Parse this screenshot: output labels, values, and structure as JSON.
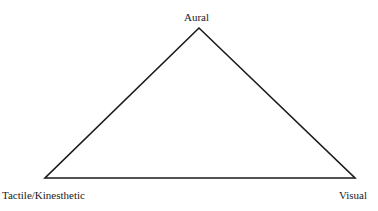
{
  "diagram": {
    "type": "triangle",
    "vertices": [
      {
        "id": "top",
        "label": "Aural",
        "x": 199,
        "y": 28
      },
      {
        "id": "bottom-left",
        "label": "Tactile/Kinesthetic",
        "x": 45,
        "y": 178
      },
      {
        "id": "bottom-right",
        "label": "Visual",
        "x": 355,
        "y": 178
      }
    ],
    "stroke_color": "#1a1a1a",
    "label_color": "#1a1a1a",
    "background": "#ffffff"
  }
}
